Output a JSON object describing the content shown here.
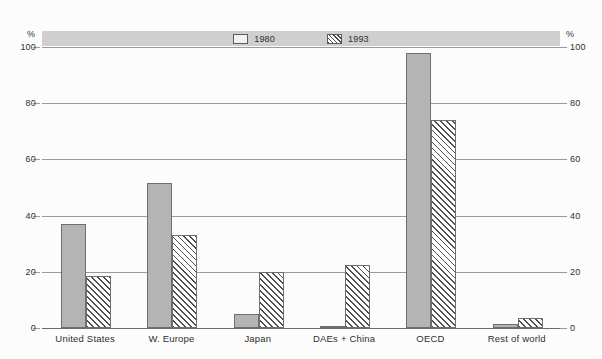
{
  "axis": {
    "unit_left": "%",
    "unit_right": "%",
    "ticks": [
      "100",
      "80",
      "60",
      "40",
      "20",
      "0"
    ]
  },
  "legend": {
    "items": [
      {
        "label": "1980",
        "swatch": "solid-gray-swatch"
      },
      {
        "label": "1993",
        "swatch": "hatched-swatch"
      }
    ]
  },
  "chart_data": {
    "type": "bar",
    "title": "",
    "xlabel": "",
    "ylabel": "%",
    "ylim": [
      0,
      100
    ],
    "yticks": [
      0,
      20,
      40,
      60,
      80,
      100
    ],
    "grid": true,
    "legend_position": "top-center",
    "categories": [
      "United States",
      "W. Europe",
      "Japan",
      "DAEs + China",
      "OECD",
      "Rest of world"
    ],
    "series": [
      {
        "name": "1980",
        "values": [
          37,
          51.5,
          5,
          0.7,
          98,
          1.5
        ]
      },
      {
        "name": "1993",
        "values": [
          18.5,
          33,
          20,
          22.5,
          74,
          3.5
        ]
      }
    ]
  }
}
